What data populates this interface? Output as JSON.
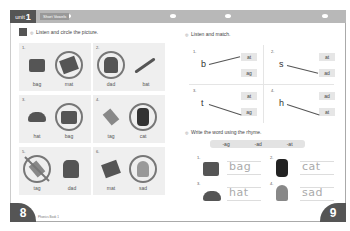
{
  "header": {
    "unit_word": "unit",
    "unit_number": "1",
    "section_label": "Short Vowels"
  },
  "left_page": {
    "page_number": "8",
    "footer": "Phonics Book 1",
    "instruction": "Listen and circle the picture.",
    "panels": [
      {
        "num": "1.",
        "left": {
          "word": "bag",
          "image": "bag-icon",
          "mark": "none"
        },
        "right": {
          "word": "mat",
          "image": "mat-icon",
          "mark": "circled"
        }
      },
      {
        "num": "2.",
        "left": {
          "word": "dad",
          "image": "dad-icon",
          "mark": "circled"
        },
        "right": {
          "word": "bat",
          "image": "bat-icon",
          "mark": "none"
        }
      },
      {
        "num": "3.",
        "left": {
          "word": "hat",
          "image": "hat-icon",
          "mark": "none"
        },
        "right": {
          "word": "bag",
          "image": "bag-icon",
          "mark": "circled"
        }
      },
      {
        "num": "4.",
        "left": {
          "word": "tag",
          "image": "tag-icon",
          "mark": "none"
        },
        "right": {
          "word": "cat",
          "image": "cat-icon",
          "mark": "circled"
        }
      },
      {
        "num": "5.",
        "left": {
          "word": "tag",
          "image": "tag-icon",
          "mark": "circled-crossed"
        },
        "right": {
          "word": "dad",
          "image": "dad-icon",
          "mark": "none"
        }
      },
      {
        "num": "6.",
        "left": {
          "word": "mat",
          "image": "mat-icon",
          "mark": "none"
        },
        "right": {
          "word": "sad",
          "image": "sad-icon",
          "mark": "circled"
        }
      }
    ]
  },
  "right_page": {
    "page_number": "9",
    "match": {
      "instruction": "Listen and match.",
      "items": [
        {
          "num": "1.",
          "letter": "b",
          "options": [
            "at",
            "ag"
          ],
          "matched": "at"
        },
        {
          "num": "2.",
          "letter": "s",
          "options": [
            "at",
            "ad"
          ],
          "matched": "ad"
        },
        {
          "num": "3.",
          "letter": "t",
          "options": [
            "at",
            "ag"
          ],
          "matched": "ag"
        },
        {
          "num": "4.",
          "letter": "h",
          "options": [
            "ad",
            "at"
          ],
          "matched": "at"
        }
      ]
    },
    "write": {
      "instruction": "Write the word using the rhyme.",
      "rhymes": [
        "-ag",
        "-ad",
        "-at"
      ],
      "items": [
        {
          "num": "1.",
          "image": "bag-icon",
          "word": "bag"
        },
        {
          "num": "2.",
          "image": "cat-icon",
          "word": "cat"
        },
        {
          "num": "3.",
          "image": "hat-icon",
          "word": "hat"
        },
        {
          "num": "4.",
          "image": "sad-icon",
          "word": "sad"
        }
      ]
    }
  }
}
